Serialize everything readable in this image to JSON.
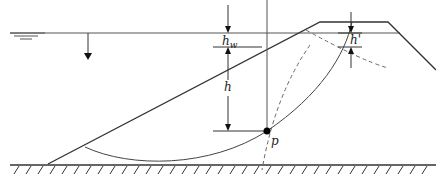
{
  "diagram": {
    "labels": {
      "hw": "h",
      "hw_sub": "w",
      "h": "h",
      "h_prime": "h'",
      "point": "p"
    },
    "colors": {
      "line": "#333333",
      "dashed": "#666666",
      "point": "#000000"
    }
  }
}
